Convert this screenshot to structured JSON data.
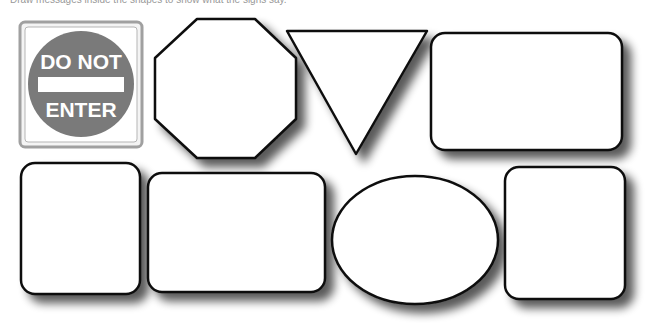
{
  "header": {
    "cutoff_text": "Draw messages inside the shapes to show what the signs say."
  },
  "signs": [
    {
      "id": "do-not-enter",
      "shape": "square",
      "line1": "DO NOT",
      "line2": "ENTER",
      "fill": "#7a7a7a",
      "text_color": "#ffffff"
    },
    {
      "id": "octagon",
      "shape": "octagon",
      "blank": true
    },
    {
      "id": "triangle",
      "shape": "inverted-triangle",
      "blank": true
    },
    {
      "id": "rect-top-right",
      "shape": "rounded-rectangle",
      "blank": true
    },
    {
      "id": "rect-bottom-left",
      "shape": "rounded-rectangle",
      "blank": true
    },
    {
      "id": "rect-bottom-wide",
      "shape": "rounded-rectangle",
      "blank": true
    },
    {
      "id": "ellipse",
      "shape": "ellipse",
      "blank": true
    },
    {
      "id": "rect-bottom-right",
      "shape": "rounded-rectangle",
      "blank": true
    }
  ],
  "colors": {
    "stroke": "#111111",
    "shadow": "#6e6e6e",
    "background": "#ffffff"
  }
}
